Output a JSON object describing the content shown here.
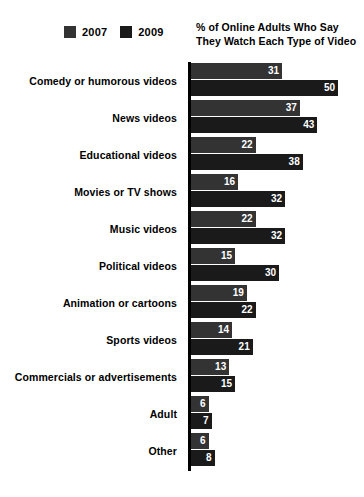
{
  "chart_data": {
    "type": "bar",
    "orientation": "horizontal",
    "title": "% of Online Adults Who Say They Watch Each Type of Video",
    "xlabel": "",
    "ylabel": "",
    "xlim": [
      0,
      50
    ],
    "grid": false,
    "legend_position": "top-left",
    "categories": [
      "Comedy or humorous videos",
      "News videos",
      "Educational videos",
      "Movies or TV shows",
      "Music videos",
      "Political videos",
      "Animation or cartoons",
      "Sports videos",
      "Commercials or advertisements",
      "Adult",
      "Other"
    ],
    "series": [
      {
        "name": "2007",
        "color": "#333333",
        "values": [
          31,
          37,
          22,
          16,
          22,
          15,
          19,
          14,
          13,
          6,
          6
        ]
      },
      {
        "name": "2009",
        "color": "#1a1a1a",
        "values": [
          50,
          43,
          38,
          32,
          32,
          30,
          22,
          21,
          15,
          7,
          8
        ]
      }
    ]
  },
  "legend": {
    "entries": [
      {
        "label": "2007",
        "color": "#333333"
      },
      {
        "label": "2009",
        "color": "#1a1a1a"
      }
    ]
  },
  "colors": {
    "background": "#ffffff",
    "axis": "#000000",
    "text": "#000000",
    "value_text": "#ffffff",
    "series_2007": "#333333",
    "series_2009": "#1a1a1a"
  }
}
